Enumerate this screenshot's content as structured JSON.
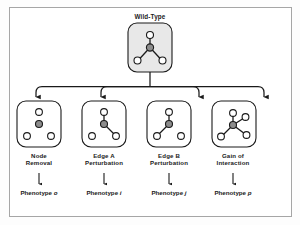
{
  "figure": {
    "title_label": "Wild-Type",
    "border_color": "#a6a6a6",
    "stroke_color": "#1a1a1a",
    "node_fill_empty": "#ffffff",
    "node_fill_hub": "#8c8c8c",
    "root_box_fill": "#e8e8e8"
  },
  "root": {
    "label": "Wild-Type",
    "nodes": [
      {
        "id": "hub",
        "type": "hub"
      },
      {
        "id": "top",
        "type": "empty"
      },
      {
        "id": "bottom-left",
        "type": "empty"
      },
      {
        "id": "bottom-right",
        "type": "empty"
      }
    ],
    "edges": [
      "hub-top",
      "hub-bottom-left",
      "hub-bottom-right"
    ]
  },
  "branches": [
    {
      "key": "node-removal",
      "label": "Node\nRemoval",
      "phenotype_prefix": "Phenotype ",
      "phenotype_symbol": "o",
      "nodes": [
        "hub",
        "top",
        "bottom-left",
        "bottom-right"
      ],
      "edges": []
    },
    {
      "key": "edge-a-perturbation",
      "label": "Edge A\nPerturbation",
      "phenotype_prefix": "Phenotype ",
      "phenotype_symbol": "i",
      "nodes": [
        "hub",
        "top",
        "bottom-left",
        "bottom-right"
      ],
      "edges": [
        "hub-top",
        "hub-bottom-right"
      ]
    },
    {
      "key": "edge-b-perturbation",
      "label": "Edge  B\nPerturbation",
      "phenotype_prefix": "Phenotype ",
      "phenotype_symbol": "j",
      "nodes": [
        "hub",
        "top",
        "bottom-left",
        "bottom-right"
      ],
      "edges": [
        "hub-top",
        "hub-bottom-left"
      ]
    },
    {
      "key": "gain-of-interaction",
      "label": "Gain of\nInteraction",
      "phenotype_prefix": "Phenotype ",
      "phenotype_symbol": "p",
      "nodes": [
        "hub",
        "top",
        "right",
        "bottom-left",
        "bottom-right"
      ],
      "edges": [
        "hub-top",
        "hub-right",
        "hub-bottom-left",
        "hub-bottom-right"
      ]
    }
  ]
}
